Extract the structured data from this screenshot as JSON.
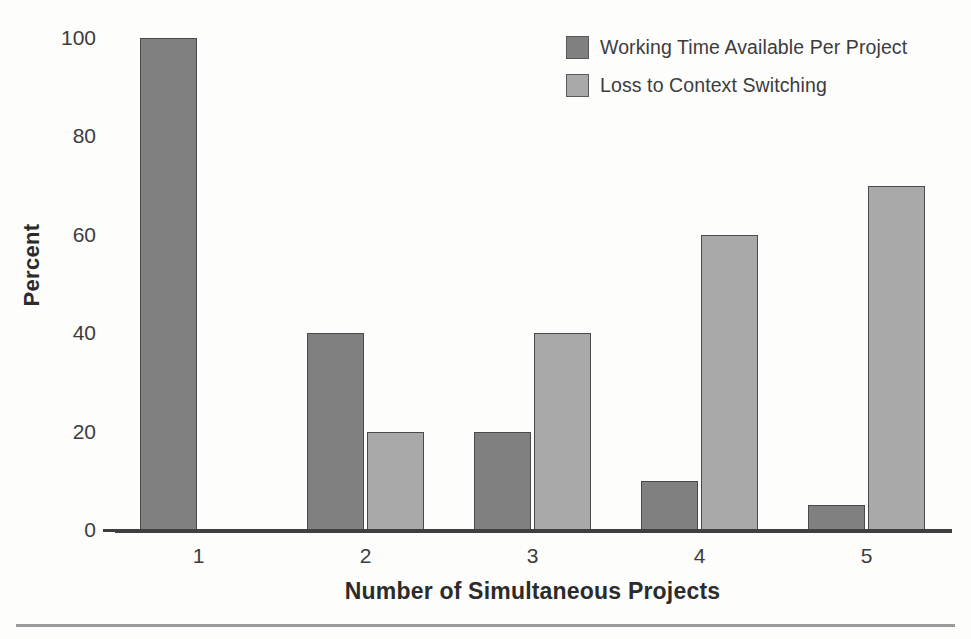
{
  "chart_data": {
    "type": "bar",
    "title": "",
    "subtitle": "",
    "xlabel": "Number of Simultaneous Projects",
    "ylabel": "Percent",
    "categories": [
      "1",
      "2",
      "3",
      "4",
      "5"
    ],
    "series": [
      {
        "name": "Working Time Available Per Project",
        "color": "#808080",
        "values": [
          100,
          40,
          20,
          10,
          5
        ]
      },
      {
        "name": "Loss to Context Switching",
        "color": "#a9a9a9",
        "values": [
          0,
          20,
          40,
          60,
          70
        ]
      }
    ],
    "yticks": [
      "0",
      "20",
      "40",
      "60",
      "80",
      "100"
    ],
    "ytick_values": [
      0,
      20,
      40,
      60,
      80,
      100
    ],
    "ylim": [
      0,
      100
    ],
    "grid": false,
    "legend_position": "top-right",
    "background_color": "#fdfdfc",
    "axis_color": "#3f3f3f",
    "bar_border_color": "#4a4a4a"
  },
  "legend": {
    "entries": [
      {
        "label": "Working Time Available Per Project",
        "color": "#808080"
      },
      {
        "label": "Loss to Context Switching",
        "color": "#a9a9a9"
      }
    ]
  }
}
